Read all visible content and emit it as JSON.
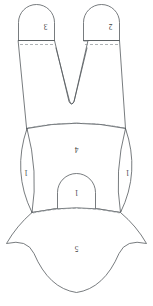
{
  "diagram": {
    "orientation": "labels-rotated-180",
    "stroke_color": "#555a5e",
    "fold_line_color": "#8d9296",
    "background_color": "#ffffff",
    "pieces": [
      {
        "id": "top-left-lobe",
        "label": "3",
        "label_x": 45.5,
        "label_y": 25.5
      },
      {
        "id": "top-right-lobe",
        "label": "2",
        "label_x": 110.5,
        "label_y": 25.5
      },
      {
        "id": "body-panel",
        "label": "4",
        "label_x": 76.5,
        "label_y": 148.5
      },
      {
        "id": "left-side-lens",
        "label": "1",
        "label_x": 26.0,
        "label_y": 172.0
      },
      {
        "id": "right-side-lens",
        "label": "1",
        "label_x": 127.5,
        "label_y": 172.0
      },
      {
        "id": "center-dome",
        "label": "1",
        "label_x": 76.5,
        "label_y": 192.0
      },
      {
        "id": "bottom-panel",
        "label": "5",
        "label_x": 76.5,
        "label_y": 248.0
      }
    ]
  }
}
